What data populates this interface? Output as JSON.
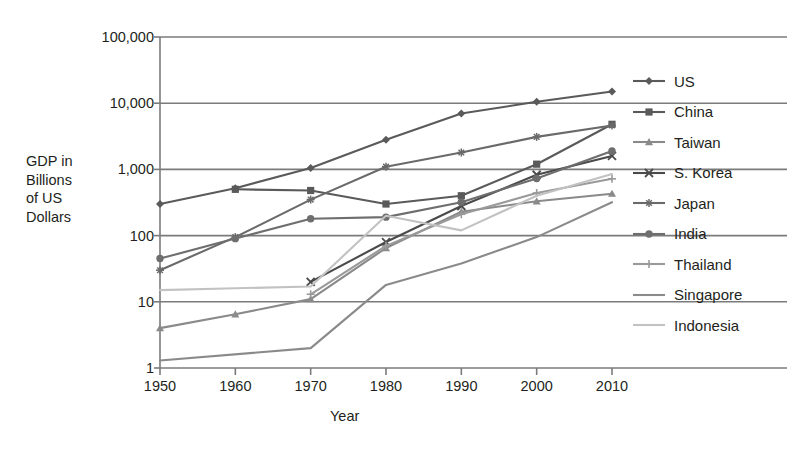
{
  "chart_data": {
    "type": "line",
    "title": "",
    "xlabel": "Year",
    "ylabel": "GDP in Billions of US Dollars",
    "x": [
      1950,
      1960,
      1970,
      1980,
      1990,
      2000,
      2010
    ],
    "xticklabels": [
      "1950",
      "1960",
      "1970",
      "1980",
      "1990",
      "2000",
      "2010"
    ],
    "yticks": [
      1,
      10,
      100,
      1000,
      10000,
      100000
    ],
    "yticklabels": [
      "1",
      "10",
      "100",
      "1,000",
      "10,000",
      "100,000"
    ],
    "yscale": "log",
    "ylim": [
      1,
      100000
    ],
    "xlim": [
      1950,
      2010
    ],
    "grid": "horizontal",
    "legend_position": "right",
    "series": [
      {
        "name": "US",
        "marker": "diamond",
        "color": "#5a5a5a",
        "values": [
          300,
          520,
          1050,
          2800,
          7000,
          10500,
          15000
        ]
      },
      {
        "name": "China",
        "marker": "square",
        "color": "#5a5a5a",
        "values": [
          null,
          500,
          480,
          300,
          400,
          1200,
          4800
        ]
      },
      {
        "name": "Taiwan",
        "marker": "triangle",
        "color": "#8a8a8a",
        "values": [
          4,
          6.5,
          11,
          65,
          230,
          330,
          430
        ]
      },
      {
        "name": "S. Korea",
        "marker": "x",
        "color": "#4a4a4a",
        "values": [
          null,
          null,
          20,
          80,
          280,
          830,
          1600
        ]
      },
      {
        "name": "Japan",
        "marker": "asterisk",
        "color": "#6a6a6a",
        "values": [
          30,
          95,
          350,
          1100,
          1800,
          3100,
          4600
        ]
      },
      {
        "name": "India",
        "marker": "circle",
        "color": "#6e6e6e",
        "values": [
          45,
          90,
          180,
          190,
          320,
          730,
          1900
        ]
      },
      {
        "name": "Thailand",
        "marker": "plus",
        "color": "#9a9a9a",
        "values": [
          null,
          null,
          13,
          70,
          210,
          440,
          720
        ]
      },
      {
        "name": "Singapore",
        "marker": "none",
        "color": "#8a8a8a",
        "values": [
          1.3,
          null,
          2.0,
          18,
          38,
          95,
          320
        ]
      },
      {
        "name": "Indonesia",
        "marker": "none",
        "color": "#c2c2c2",
        "values": [
          15,
          16,
          17,
          200,
          120,
          400,
          850
        ]
      }
    ]
  },
  "axes": {
    "y_label_lines": [
      "GDP in",
      "Billions",
      "of US",
      "Dollars"
    ],
    "x_label": "Year"
  },
  "legend": {
    "items": [
      {
        "label": "US",
        "marker": "diamond-marker-icon"
      },
      {
        "label": "China",
        "marker": "square-marker-icon"
      },
      {
        "label": "Taiwan",
        "marker": "triangle-marker-icon"
      },
      {
        "label": "S. Korea",
        "marker": "x-marker-icon"
      },
      {
        "label": "Japan",
        "marker": "asterisk-marker-icon"
      },
      {
        "label": "India",
        "marker": "circle-marker-icon"
      },
      {
        "label": "Thailand",
        "marker": "plus-marker-icon"
      },
      {
        "label": "Singapore",
        "marker": "line-marker-icon"
      },
      {
        "label": "Indonesia",
        "marker": "line-marker-icon"
      }
    ]
  },
  "colors": {
    "text": "#231f20",
    "grid": "#7b7b7b",
    "axis": "#7b7b7b",
    "background": "#ffffff"
  }
}
